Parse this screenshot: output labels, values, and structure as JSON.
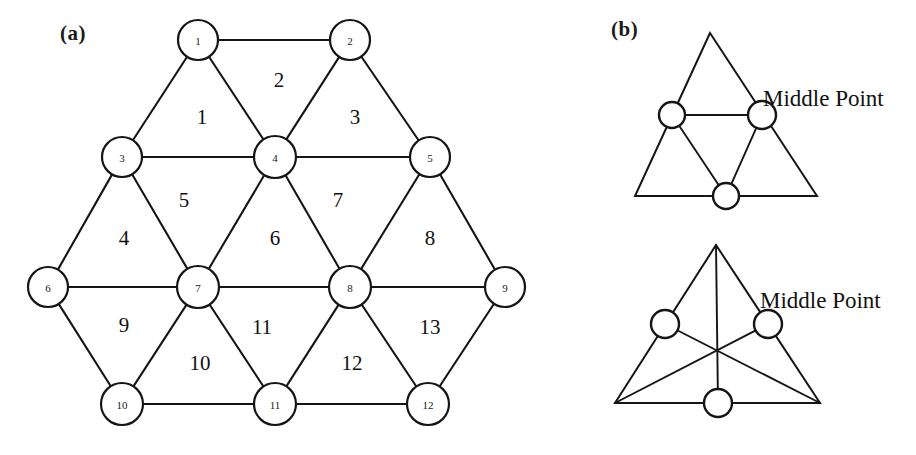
{
  "figure": {
    "panels": [
      {
        "id": "a",
        "label": "(a)"
      },
      {
        "id": "b",
        "label": "(b)"
      }
    ]
  },
  "panel_a": {
    "label": "(a)",
    "nodes": [
      {
        "id": 1,
        "label": "1",
        "x": 198,
        "y": 40,
        "r": 20
      },
      {
        "id": 2,
        "label": "2",
        "x": 350,
        "y": 40,
        "r": 20
      },
      {
        "id": 3,
        "label": "3",
        "x": 122,
        "y": 157,
        "r": 20
      },
      {
        "id": 4,
        "label": "4",
        "x": 275,
        "y": 157,
        "r": 21
      },
      {
        "id": 5,
        "label": "5",
        "x": 430,
        "y": 157,
        "r": 20
      },
      {
        "id": 6,
        "label": "6",
        "x": 48,
        "y": 287,
        "r": 20
      },
      {
        "id": 7,
        "label": "7",
        "x": 198,
        "y": 287,
        "r": 21
      },
      {
        "id": 8,
        "label": "8",
        "x": 350,
        "y": 287,
        "r": 21
      },
      {
        "id": 9,
        "label": "9",
        "x": 505,
        "y": 287,
        "r": 20
      },
      {
        "id": 10,
        "label": "10",
        "x": 122,
        "y": 404,
        "r": 21
      },
      {
        "id": 11,
        "label": "11",
        "x": 275,
        "y": 404,
        "r": 21
      },
      {
        "id": 12,
        "label": "12",
        "x": 428,
        "y": 404,
        "r": 21
      }
    ],
    "edges": [
      [
        1,
        2
      ],
      [
        1,
        3
      ],
      [
        1,
        4
      ],
      [
        2,
        4
      ],
      [
        2,
        5
      ],
      [
        3,
        4
      ],
      [
        4,
        5
      ],
      [
        3,
        6
      ],
      [
        3,
        7
      ],
      [
        4,
        7
      ],
      [
        4,
        8
      ],
      [
        5,
        8
      ],
      [
        5,
        9
      ],
      [
        6,
        7
      ],
      [
        7,
        8
      ],
      [
        8,
        9
      ],
      [
        6,
        10
      ],
      [
        7,
        10
      ],
      [
        7,
        11
      ],
      [
        8,
        11
      ],
      [
        8,
        12
      ],
      [
        9,
        12
      ],
      [
        10,
        11
      ],
      [
        11,
        12
      ]
    ],
    "faces": [
      {
        "label": "1",
        "x": 202,
        "y": 117
      },
      {
        "label": "2",
        "x": 279,
        "y": 80
      },
      {
        "label": "3",
        "x": 355,
        "y": 117
      },
      {
        "label": "4",
        "x": 124,
        "y": 238
      },
      {
        "label": "5",
        "x": 184,
        "y": 200
      },
      {
        "label": "6",
        "x": 275,
        "y": 238
      },
      {
        "label": "7",
        "x": 338,
        "y": 200
      },
      {
        "label": "8",
        "x": 430,
        "y": 238
      },
      {
        "label": "9",
        "x": 124,
        "y": 325
      },
      {
        "label": "10",
        "x": 200,
        "y": 363
      },
      {
        "label": "11",
        "x": 262,
        "y": 327
      },
      {
        "label": "12",
        "x": 352,
        "y": 363
      },
      {
        "label": "13",
        "x": 430,
        "y": 327
      }
    ]
  },
  "panel_b": {
    "label": "(b)",
    "diagrams": [
      {
        "id": "midpoint-subdivision",
        "annotation": "Middle Point",
        "annotation_x": 763,
        "annotation_y": 98,
        "vertices": [
          {
            "name": "apex",
            "x": 710,
            "y": 33
          },
          {
            "name": "left",
            "x": 635,
            "y": 196
          },
          {
            "name": "right",
            "x": 817,
            "y": 196
          }
        ],
        "midpoints": [
          {
            "name": "left-mid",
            "x": 672,
            "y": 115,
            "r": 13
          },
          {
            "name": "right-mid",
            "x": 762,
            "y": 115,
            "r": 14
          },
          {
            "name": "bottom-mid",
            "x": 726,
            "y": 196,
            "r": 13
          }
        ],
        "inner_edges": [
          [
            "left-mid",
            "right-mid"
          ],
          [
            "right-mid",
            "bottom-mid"
          ],
          [
            "bottom-mid",
            "left-mid"
          ]
        ]
      },
      {
        "id": "median-centroid",
        "annotation": "Middle Point",
        "annotation_x": 760,
        "annotation_y": 300,
        "vertices": [
          {
            "name": "apex",
            "x": 716,
            "y": 245
          },
          {
            "name": "left",
            "x": 615,
            "y": 403
          },
          {
            "name": "right",
            "x": 820,
            "y": 403
          }
        ],
        "midpoints": [
          {
            "name": "left-mid",
            "x": 665,
            "y": 324,
            "r": 14
          },
          {
            "name": "right-mid",
            "x": 768,
            "y": 324,
            "r": 14
          },
          {
            "name": "bottom-mid",
            "x": 718,
            "y": 403,
            "r": 14
          }
        ],
        "medians": [
          {
            "from": "apex",
            "to": "bottom-mid"
          },
          {
            "from": "left",
            "to": "right-mid"
          },
          {
            "from": "right",
            "to": "left-mid"
          }
        ]
      }
    ]
  },
  "colors": {
    "ink": "#151515",
    "background": "#ffffff"
  }
}
